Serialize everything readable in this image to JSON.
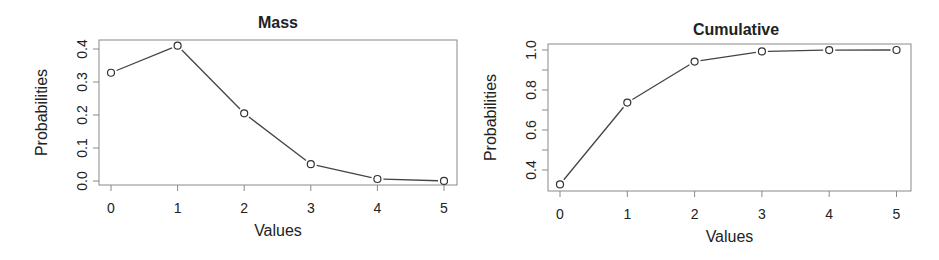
{
  "chart_data": [
    {
      "type": "line",
      "title": "Mass",
      "xlabel": "Values",
      "ylabel": "Probabilities",
      "x": [
        0,
        1,
        2,
        3,
        4,
        5
      ],
      "values": [
        0.328,
        0.41,
        0.205,
        0.051,
        0.006,
        0.0003
      ],
      "xticks": [
        "0",
        "1",
        "2",
        "3",
        "4",
        "5"
      ],
      "yticks": [
        "0.0",
        "0.1",
        "0.2",
        "0.3",
        "0.4"
      ],
      "ylim": [
        -0.01,
        0.42
      ],
      "grid": false,
      "marker": "open-circle"
    },
    {
      "type": "line",
      "title": "Cumulative",
      "xlabel": "Values",
      "ylabel": "Probabilities",
      "x": [
        0,
        1,
        2,
        3,
        4,
        5
      ],
      "values": [
        0.328,
        0.737,
        0.942,
        0.993,
        0.9997,
        1.0
      ],
      "xticks": [
        "0",
        "1",
        "2",
        "3",
        "4",
        "5"
      ],
      "yticks": [
        "0.4",
        "0.6",
        "0.8",
        "1.0"
      ],
      "ylim": [
        0.3,
        1.02
      ],
      "grid": false,
      "marker": "open-circle"
    }
  ]
}
